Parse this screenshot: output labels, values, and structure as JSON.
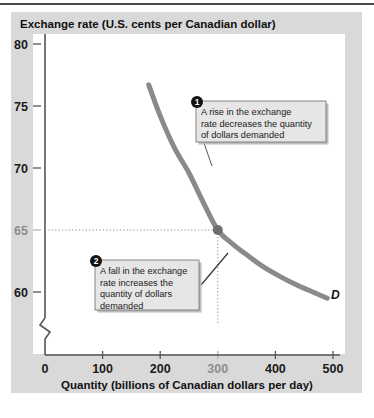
{
  "figure": {
    "title": "Exchange rate (U.S. cents per Canadian dollar)",
    "panel_color": "#d9d9d9",
    "plot_bg": "#ffffff"
  },
  "chart_data": {
    "type": "line",
    "title": "Exchange rate (U.S. cents per Canadian dollar)",
    "xlabel": "Quantity (billions of Canadian dollars per day)",
    "ylabel": "Exchange rate (U.S. cents per Canadian dollar)",
    "xlim": [
      0,
      520
    ],
    "ylim": [
      57.5,
      81.5
    ],
    "grid": false,
    "legend_position": "none",
    "xticks": [
      0,
      100,
      200,
      300,
      400,
      500
    ],
    "xtick_labels": [
      "0",
      "100",
      "200",
      "300",
      "400",
      "500"
    ],
    "yticks": [
      60,
      65,
      70,
      75,
      80
    ],
    "ytick_labels": [
      "60",
      "65",
      "70",
      "75",
      "80"
    ],
    "highlight_xtick": "300",
    "highlight_ytick": "65",
    "axis_break": true,
    "series": [
      {
        "name": "D",
        "label": "D",
        "color": "#8a8a8a",
        "linewidth": 5,
        "x": [
          180,
          200,
          225,
          250,
          275,
          300,
          325,
          350,
          380,
          410,
          440,
          470,
          490
        ],
        "y": [
          76.7,
          74.2,
          71.6,
          69.6,
          67.2,
          65.0,
          63.9,
          63.0,
          62.0,
          61.2,
          60.5,
          59.9,
          59.5
        ]
      }
    ],
    "points": [
      {
        "name": "equilibrium-point",
        "x": 300,
        "y": 65,
        "color": "#6f6f6f",
        "radius": 5
      }
    ],
    "guide_lines": [
      {
        "name": "horizontal-guide",
        "from": [
          0,
          65
        ],
        "to": [
          300,
          65
        ],
        "style": "dotted"
      },
      {
        "name": "vertical-guide",
        "from": [
          300,
          65
        ],
        "to": [
          300,
          57.5
        ],
        "style": "dotted"
      }
    ],
    "annotations": [
      {
        "number": "1",
        "lines": [
          "A rise in the exchange",
          "rate decreases the quantity",
          "of dollars demanded"
        ],
        "text": "A rise in the exchange rate decreases the quantity of dollars demanded"
      },
      {
        "number": "2",
        "lines": [
          "A fall in the exchange",
          "rate increases the",
          "quantity of dollars",
          "demanded"
        ],
        "text": "A fall in the exchange rate increases the quantity of dollars demanded"
      }
    ]
  }
}
